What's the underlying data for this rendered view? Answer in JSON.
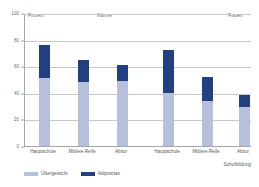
{
  "chart_data": {
    "type": "bar",
    "subtype": "stacked-bar",
    "title": "",
    "xlabel": "Schulbildung",
    "ylabel": "Prozent",
    "ylim": [
      0,
      100
    ],
    "yticks": [
      0,
      20,
      40,
      60,
      80,
      100
    ],
    "grid": true,
    "legend_position": "bottom-left",
    "group_labels": [
      "Männer",
      "Frauen"
    ],
    "categories": [
      "Hauptschule",
      "Mittlere Reife",
      "Abitur",
      "Hauptschule",
      "Mittlere Reife",
      "Abitur"
    ],
    "series": [
      {
        "name": "Übergewicht",
        "color": "#b6c0db",
        "values": [
          51,
          48,
          49,
          40,
          34,
          29
        ]
      },
      {
        "name": "Adipositas",
        "color": "#22407f",
        "values": [
          25,
          17,
          12,
          32,
          18,
          9
        ]
      }
    ],
    "totals": [
      76,
      65,
      61,
      72,
      52,
      38
    ],
    "annotations": {
      "top_left": "Prozent",
      "top_center": "Männer",
      "top_right": "Frauen"
    }
  },
  "axis": {
    "y_ticks": [
      "100",
      "80",
      "60",
      "40",
      "20",
      "0"
    ],
    "x_title": "Schulbildung"
  },
  "notes": {
    "prozent": "Prozent",
    "maenner": "Männer",
    "frauen": "Frauen"
  },
  "legend": {
    "items": [
      {
        "label": "Übergewicht",
        "color": "#b6c0db"
      },
      {
        "label": "Adipositas",
        "color": "#22407f"
      }
    ]
  },
  "colors": {
    "uebergewicht": "#b6c0db",
    "adipositas": "#22407f",
    "axis": "#a6a6a8",
    "grid": "#c8c8ca",
    "text": "#58585a",
    "background": "#ffffff"
  }
}
